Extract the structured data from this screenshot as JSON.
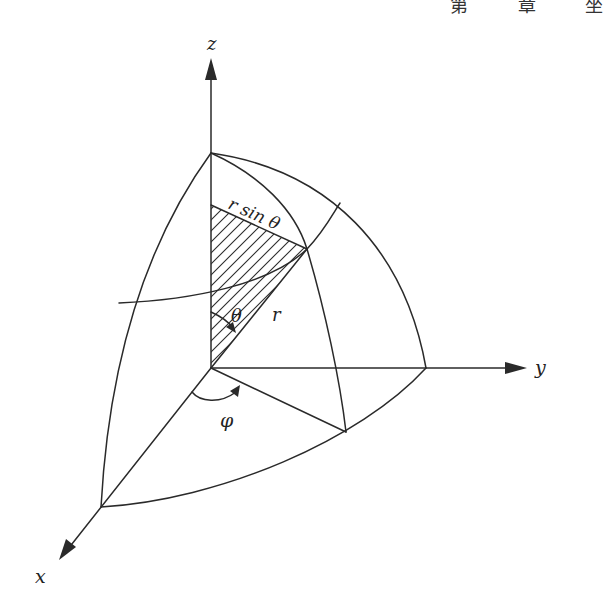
{
  "header": {
    "text": "第 章 坐"
  },
  "diagram": {
    "labels": {
      "z_axis": "z",
      "y_axis": "y",
      "x_axis": "x",
      "r_sin_theta": "r sin θ",
      "theta": "θ",
      "r": "r",
      "phi": "φ"
    },
    "colors": {
      "stroke": "#2a2a2a",
      "background": "#ffffff"
    }
  }
}
